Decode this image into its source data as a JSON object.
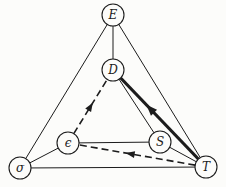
{
  "figure": {
    "background_color": "#fcfcfa",
    "line_color": "#1c1c1c",
    "node_fill_color": "#fcfcfa",
    "node_radius": 11,
    "nodes": [
      {
        "id": "E",
        "label": "E",
        "x": 113,
        "y": 15
      },
      {
        "id": "D",
        "label": "D",
        "x": 113,
        "y": 70
      },
      {
        "id": "epsilon",
        "label": "ϵ",
        "x": 68,
        "y": 143
      },
      {
        "id": "S",
        "label": "S",
        "x": 160,
        "y": 142
      },
      {
        "id": "sigma",
        "label": "σ",
        "x": 20,
        "y": 168
      },
      {
        "id": "T",
        "label": "T",
        "x": 206,
        "y": 167
      }
    ],
    "edges": [
      {
        "from": "E",
        "to": "D",
        "style": "solid"
      },
      {
        "from": "E",
        "to": "sigma",
        "style": "solid"
      },
      {
        "from": "E",
        "to": "T",
        "style": "solid"
      },
      {
        "from": "sigma",
        "to": "epsilon",
        "style": "solid"
      },
      {
        "from": "sigma",
        "to": "T",
        "style": "solid"
      },
      {
        "from": "epsilon",
        "to": "S",
        "style": "solid"
      },
      {
        "from": "S",
        "to": "T",
        "style": "solid"
      },
      {
        "from": "D",
        "to": "S",
        "style": "solid"
      },
      {
        "from": "T",
        "to": "D",
        "style": "thick",
        "arrow": true,
        "arrow_at": 0.6,
        "arrow_len": 11,
        "arrow_halfwidth": 4.2
      },
      {
        "from": "T",
        "to": "epsilon",
        "style": "dashed",
        "arrow": true,
        "arrow_at": 0.55,
        "arrow_len": 9,
        "arrow_halfwidth": 3.4
      },
      {
        "from": "epsilon",
        "to": "D",
        "style": "dashed",
        "arrow": true,
        "arrow_at": 0.5,
        "arrow_len": 9,
        "arrow_halfwidth": 3.4
      }
    ]
  }
}
